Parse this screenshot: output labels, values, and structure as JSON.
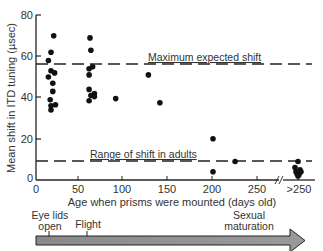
{
  "chart_data": {
    "type": "scatter",
    "title": "",
    "xlabel": "Age when prisms were mounted (days old)",
    "ylabel": "Mean shift in ITD tuning (µsec)",
    "xlim": [
      0,
      270
    ],
    "ylim": [
      0,
      80
    ],
    "x_ticks": [
      "0",
      "50",
      "100",
      "150",
      "200",
      "250",
      ">250"
    ],
    "y_ticks": [
      "0",
      "20",
      "40",
      "60",
      "80"
    ],
    "grid": false,
    "legend": null,
    "series": [
      {
        "name": "Owls",
        "points": [
          {
            "x": 20,
            "y": 70
          },
          {
            "x": 17,
            "y": 62
          },
          {
            "x": 14,
            "y": 58
          },
          {
            "x": 17,
            "y": 53
          },
          {
            "x": 21,
            "y": 52
          },
          {
            "x": 14,
            "y": 50
          },
          {
            "x": 19,
            "y": 47
          },
          {
            "x": 19,
            "y": 43
          },
          {
            "x": 16,
            "y": 39
          },
          {
            "x": 17,
            "y": 36
          },
          {
            "x": 22,
            "y": 36.5
          },
          {
            "x": 17,
            "y": 34
          },
          {
            "x": 61,
            "y": 69
          },
          {
            "x": 62,
            "y": 63
          },
          {
            "x": 64,
            "y": 55
          },
          {
            "x": 60,
            "y": 54
          },
          {
            "x": 60,
            "y": 51
          },
          {
            "x": 60,
            "y": 44
          },
          {
            "x": 66,
            "y": 42
          },
          {
            "x": 62,
            "y": 41
          },
          {
            "x": 66,
            "y": 40.5
          },
          {
            "x": 60,
            "y": 38.5
          },
          {
            "x": 90,
            "y": 39.5
          },
          {
            "x": 127,
            "y": 51
          },
          {
            "x": 140,
            "y": 37.5
          },
          {
            "x": 200,
            "y": 20
          },
          {
            "x": 200,
            "y": 4
          },
          {
            "x": 225,
            "y": 9
          },
          {
            "x": ">250",
            "y": 9
          },
          {
            "x": ">250",
            "y": 6
          },
          {
            "x": ">250",
            "y": 5
          },
          {
            "x": ">250",
            "y": 4
          },
          {
            "x": ">250",
            "y": 4
          },
          {
            "x": ">250",
            "y": 3
          },
          {
            "x": ">250",
            "y": 2.5
          },
          {
            "x": ">250",
            "y": 2
          }
        ]
      }
    ],
    "reference_lines": [
      {
        "label": "Maximum expected shift",
        "y": 56,
        "style": "dashed"
      },
      {
        "label": "Range of shift in adults",
        "y": 9,
        "style": "dashed"
      }
    ],
    "timeline": {
      "label_eyelids": [
        "Eye lids",
        "open"
      ],
      "label_flight": "Flight",
      "label_sexual": [
        "Sexual",
        "maturation"
      ]
    }
  }
}
